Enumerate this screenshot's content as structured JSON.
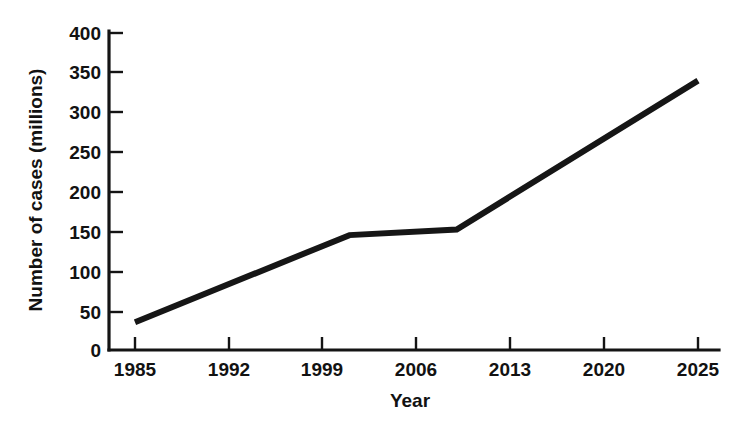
{
  "chart_data": {
    "type": "line",
    "title": "",
    "xlabel": "Year",
    "ylabel": "Number of cases (millions)",
    "xlim": [
      1985,
      2025
    ],
    "ylim": [
      0,
      400
    ],
    "grid": false,
    "legend": "none",
    "x_ticks": [
      "1985",
      "1992",
      "1999",
      "2006",
      "2013",
      "2020",
      "2025"
    ],
    "y_ticks": [
      "0",
      "50",
      "100",
      "150",
      "200",
      "250",
      "300",
      "350",
      "400"
    ],
    "x": [
      1985,
      2001,
      2009,
      2025
    ],
    "values": [
      35,
      145,
      152,
      340
    ],
    "series": [
      {
        "name": "Number of cases",
        "color": "#161616",
        "points": [
          {
            "year": 1985,
            "cases": 35
          },
          {
            "year": 2001,
            "cases": 145
          },
          {
            "year": 2009,
            "cases": 152
          },
          {
            "year": 2025,
            "cases": 340
          }
        ]
      }
    ]
  },
  "axes": {
    "y_title": "Number of cases (millions)",
    "x_title": "Year",
    "y_tick_labels": [
      "400",
      "350",
      "300",
      "250",
      "200",
      "150",
      "100",
      "50",
      "0"
    ],
    "x_tick_labels": [
      "1985",
      "1992",
      "1999",
      "2006",
      "2013",
      "2020",
      "2025"
    ]
  },
  "colors": {
    "line": "#161616",
    "axis": "#141414",
    "text": "#121212",
    "background": "#ffffff"
  }
}
